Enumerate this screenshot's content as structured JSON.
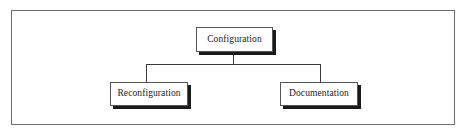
{
  "diagram": {
    "frame": {
      "label": "diagram-border"
    },
    "nodes": {
      "root": {
        "label": "Configuration",
        "x": 196,
        "y": 27,
        "w": 77,
        "h": 25
      },
      "left_child": {
        "label": "Reconfiguration",
        "x": 110,
        "y": 82,
        "w": 78,
        "h": 24
      },
      "right_child": {
        "label": "Documentation",
        "x": 280,
        "y": 82,
        "w": 78,
        "h": 24
      }
    },
    "connectors": {
      "root_stem": {
        "x": 233,
        "y": 52,
        "length": 12,
        "orientation": "vertical"
      },
      "crossbar": {
        "x": 146,
        "y": 64,
        "length": 175,
        "orientation": "horizontal"
      },
      "left_drop": {
        "x": 146,
        "y": 64,
        "length": 18,
        "orientation": "vertical"
      },
      "right_drop": {
        "x": 320,
        "y": 64,
        "length": 18,
        "orientation": "vertical"
      }
    },
    "colors": {
      "frame_border": "#6e6e6e",
      "node_border": "#555555",
      "node_fill": "#ffffff",
      "node_shadow": "#1a1a1a",
      "line": "#3a3a3a",
      "text": "#1a1a1a",
      "background": "#ffffff"
    }
  }
}
